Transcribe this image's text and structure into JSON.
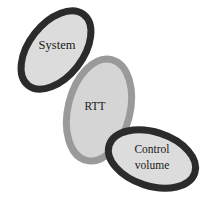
{
  "diagram": {
    "type": "venn-chain",
    "canvas": {
      "width": 210,
      "height": 204,
      "background": "#ffffff"
    },
    "palette": {
      "fill_light_gray": "#dcdcdc",
      "fill_rtt_gray": "#d5d5d5",
      "border_dark": "#2b2b2b",
      "border_gray": "#9a9a9a",
      "text_color": "#1a1a1a",
      "background": "#ffffff"
    },
    "ellipses": [
      {
        "id": "system",
        "label": "System",
        "border_color": "#2b2b2b",
        "fill_color": "#dcdcdc",
        "border_width": 7,
        "cx": 56,
        "cy": 50,
        "rx": 27,
        "ry": 45,
        "rotation_deg": 38,
        "z": 3
      },
      {
        "id": "rtt",
        "label": "RTT",
        "border_color": "#9a9a9a",
        "fill_color": "#d5d5d5",
        "border_width": 7,
        "cx": 99,
        "cy": 110,
        "rx": 31,
        "ry": 52,
        "rotation_deg": 14,
        "z": 1
      },
      {
        "id": "control-volume",
        "label": "Control volume",
        "label_lines": [
          "Control",
          "volume"
        ],
        "border_color": "#2b2b2b",
        "fill_color": "#dcdcdc",
        "border_width": 7,
        "cx": 152,
        "cy": 159,
        "rx": 45,
        "ry": 27,
        "rotation_deg": 18,
        "z": 3
      }
    ],
    "labels": {
      "system": "System",
      "rtt": "RTT",
      "control_volume_line1": "Control",
      "control_volume_line2": "volume"
    }
  }
}
